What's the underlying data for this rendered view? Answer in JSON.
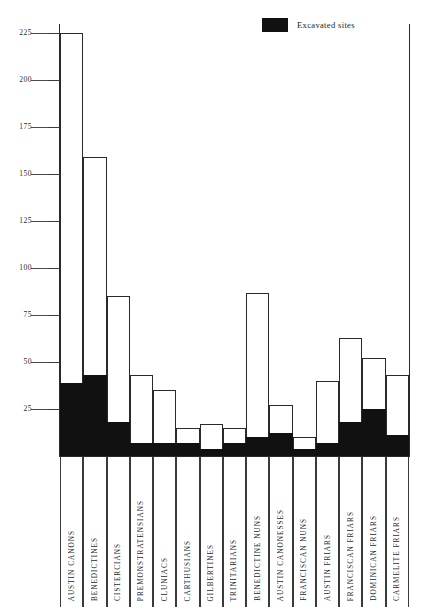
{
  "legend": {
    "swatch_name": "excavated-sites-swatch",
    "label": "Excavated sites",
    "color": "#111111"
  },
  "axis": {
    "y_ticks": [
      "225",
      "200",
      "175",
      "150",
      "125",
      "100",
      "75",
      "50",
      "25"
    ],
    "y_min": 0,
    "y_max": 230
  },
  "chart_data": {
    "type": "bar",
    "title": "",
    "subtitle": "",
    "xlabel": "",
    "ylabel": "",
    "ylim": [
      0,
      230
    ],
    "grid": false,
    "legend_position": "top-right",
    "stacked": true,
    "categories": [
      "AUSTIN CANONS",
      "BENEDICTINES",
      "CISTERCIANS",
      "PREMONSTRATENSIANS",
      "CLUNIACS",
      "CARTHUSIANS",
      "GILBERTINES",
      "TRINITARIANS",
      "BENEDICTINE NUNS",
      "AUSTIN CANONESSES",
      "FRANCISCAN NUNS",
      "AUSTIN FRIARS",
      "FRANCISCAN FRIARS",
      "DOMINICAN FRIARS",
      "CARMELITE FRIARS"
    ],
    "series": [
      {
        "name": "Total sites",
        "color": "#ffffff",
        "values": [
          225,
          159,
          85,
          43,
          35,
          15,
          17,
          15,
          87,
          27,
          10,
          40,
          63,
          52,
          43
        ]
      },
      {
        "name": "Excavated sites",
        "color": "#111111",
        "values": [
          39,
          43,
          18,
          7,
          7,
          7,
          4,
          7,
          10,
          12,
          4,
          7,
          18,
          25,
          11
        ]
      }
    ],
    "y_ticks": [
      25,
      50,
      75,
      100,
      125,
      150,
      175,
      200,
      225
    ]
  }
}
